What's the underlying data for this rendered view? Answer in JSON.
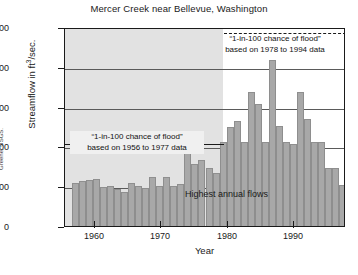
{
  "chart_data": {
    "type": "bar",
    "title": "Mercer Creek near Bellevue, Washington",
    "xlabel": "Year",
    "ylabel": "Streamflow in ft3/sec.",
    "ylabel_base": "Streamflow in ft",
    "ylabel_exp": "3",
    "ylabel_tail": "/sec.",
    "ylim": [
      0,
      1000
    ],
    "xlim": [
      1955,
      1995
    ],
    "grid": true,
    "legend": "none",
    "series_name": "Highest annual flows",
    "ytick_labels": [
      "1,000",
      "800",
      "600",
      "400",
      "200",
      "0"
    ],
    "ytick_values": [
      1000,
      800,
      600,
      400,
      200,
      0
    ],
    "xtick_labels": [
      "1960",
      "1970",
      "1980",
      "1990"
    ],
    "xtick_values": [
      1960,
      1970,
      1980,
      1990
    ],
    "categories": [
      1956,
      1957,
      1958,
      1959,
      1960,
      1961,
      1962,
      1963,
      1964,
      1965,
      1966,
      1967,
      1968,
      1969,
      1970,
      1971,
      1972,
      1973,
      1974,
      1975,
      1976,
      1977,
      1978,
      1979,
      1980,
      1981,
      1982,
      1983,
      1984,
      1985,
      1986,
      1987,
      1988,
      1989,
      1990,
      1991,
      1992,
      1993,
      1994,
      1995
    ],
    "values": [
      215,
      225,
      230,
      235,
      195,
      200,
      185,
      170,
      215,
      200,
      190,
      245,
      200,
      245,
      200,
      210,
      415,
      310,
      330,
      290,
      265,
      420,
      500,
      530,
      420,
      675,
      615,
      420,
      835,
      505,
      420,
      410,
      675,
      540,
      420,
      420,
      290,
      290,
      205,
      290
    ],
    "annotations": [
      {
        "id": "flood-1956-1977",
        "line1": "“1-in-100 chance of flood”",
        "line2": "based on 1956 to 1977 data",
        "level": 420,
        "style": "solid",
        "span": "1956-1977"
      },
      {
        "id": "flood-1978-1994",
        "line1": "“1-in-100 chance of flood”",
        "line2": "based on 1978 to 1994 data",
        "level": 980,
        "style": "dashed",
        "span": "1978-1995"
      }
    ],
    "shaded_region": {
      "from": 1955,
      "to": 1977.5,
      "color": "#e2e2e2"
    },
    "bar_color": "#a8a8a8",
    "axis_color": "#1a1a1a",
    "credit": "Greene, USGS."
  }
}
